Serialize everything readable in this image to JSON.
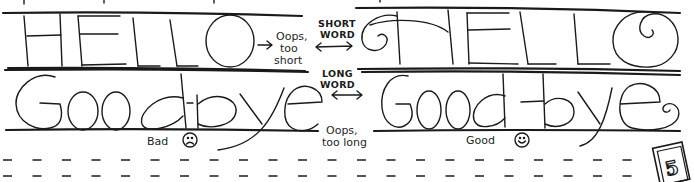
{
  "illustration": {
    "title": "Word spacing on guide lines",
    "top_row": {
      "bad_example_word": "HELLO",
      "good_example_word": "HELLO",
      "bad_note": [
        "Oops,",
        "too",
        "short"
      ],
      "middle_label": [
        "SHORT",
        "WORD"
      ]
    },
    "bottom_row": {
      "bad_example_word": "Goodbye",
      "good_example_word": "Good-bye",
      "bad_note": [
        "Oops,",
        "too long"
      ],
      "middle_label": [
        "LONG",
        "WORD"
      ],
      "bad_caption": "Bad",
      "good_caption": "Good"
    },
    "icons": {
      "bad": "frown-face-icon",
      "good": "smile-face-icon",
      "arrow": "double-arrow-icon"
    },
    "page_badge": "5",
    "colors": {
      "ink": "#1a1a1a",
      "paper": "#ffffff"
    }
  }
}
